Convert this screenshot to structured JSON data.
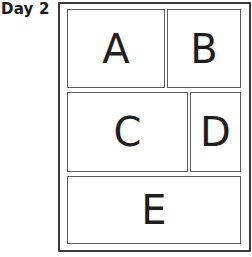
{
  "title": "Day 2",
  "layout": {
    "description": "Page layout diagram with five panels arranged in three rows",
    "rows": [
      {
        "panels": [
          "A",
          "B"
        ]
      },
      {
        "panels": [
          "C",
          "D"
        ]
      },
      {
        "panels": [
          "E"
        ]
      }
    ]
  },
  "panels": {
    "a": {
      "label": "A"
    },
    "b": {
      "label": "B"
    },
    "c": {
      "label": "C"
    },
    "d": {
      "label": "D"
    },
    "e": {
      "label": "E"
    }
  },
  "colors": {
    "frame_border": "#3a3a3a",
    "panel_border": "#5a5a5a",
    "text": "#1e1e1e",
    "background": "#ffffff"
  }
}
